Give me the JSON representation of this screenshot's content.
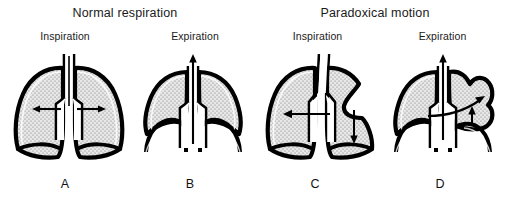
{
  "diagram": {
    "type": "medical-illustration",
    "background_color": "#ffffff",
    "ink_color": "#000000",
    "lung_fill_color": "#d9d9d9"
  },
  "groups": [
    {
      "id": "normal",
      "title": "Normal respiration",
      "title_x": 55,
      "title_y": 6,
      "title_width": 140
    },
    {
      "id": "paradoxical",
      "title": "Paradoxical motion",
      "title_x": 300,
      "title_y": 6,
      "title_width": 150
    }
  ],
  "panels": [
    {
      "id": "panel-a",
      "letter": "A",
      "phase": "Inspiration",
      "group": "normal",
      "figure_x": 6,
      "phase_x": 20,
      "phase_y": 30,
      "phase_width": 90,
      "letter_x": 40,
      "letter_y": 177,
      "letter_width": 50,
      "description": "Normal inspiration: lungs fully expanded, diaphragm flattened and descended, chest wall expands outward",
      "diaphragm": "flattened",
      "lung_size": "expanded",
      "arrows": [
        {
          "name": "trachea-airflow-down",
          "direction": "down",
          "style": "outline"
        },
        {
          "name": "chest-expansion-left",
          "direction": "left",
          "style": "solid"
        },
        {
          "name": "chest-expansion-right",
          "direction": "right",
          "style": "solid"
        }
      ]
    },
    {
      "id": "panel-b",
      "letter": "B",
      "phase": "Expiration",
      "group": "normal",
      "figure_x": 130,
      "phase_x": 150,
      "phase_y": 30,
      "phase_width": 90,
      "letter_x": 165,
      "letter_y": 177,
      "letter_width": 50,
      "description": "Normal expiration: lungs reduced in volume, diaphragm domed upward, air expelled through trachea",
      "diaphragm": "domed",
      "lung_size": "reduced",
      "arrows": [
        {
          "name": "trachea-airflow-up",
          "direction": "up",
          "style": "solid"
        }
      ]
    },
    {
      "id": "panel-c",
      "letter": "C",
      "phase": "Inspiration",
      "group": "paradoxical",
      "figure_x": 258,
      "phase_x": 270,
      "phase_y": 30,
      "phase_width": 95,
      "letter_x": 290,
      "letter_y": 177,
      "letter_width": 50,
      "description": "Paradoxical inspiration: flail segment sinks inward on the affected side, mediastinum shifts to the unaffected side and affected lung deflates",
      "diaphragm": "flattened",
      "lung_size": "expanded",
      "flail_side": "right",
      "flail_motion": "inward",
      "arrows": [
        {
          "name": "trachea-airflow-down",
          "direction": "down",
          "style": "outline"
        },
        {
          "name": "mediastinal-shift-left",
          "direction": "left",
          "style": "solid"
        },
        {
          "name": "flail-segment-collapse-down",
          "direction": "down",
          "style": "solid"
        }
      ]
    },
    {
      "id": "panel-d",
      "letter": "D",
      "phase": "Expiration",
      "group": "paradoxical",
      "figure_x": 380,
      "phase_x": 395,
      "phase_y": 30,
      "phase_width": 95,
      "letter_x": 415,
      "letter_y": 177,
      "letter_width": 50,
      "description": "Paradoxical expiration: flail segment bulges outward, mediastinum swings back toward the affected side as air shifts across",
      "diaphragm": "domed",
      "lung_size": "reduced",
      "flail_side": "right",
      "flail_motion": "outward",
      "arrows": [
        {
          "name": "trachea-airflow-up",
          "direction": "up",
          "style": "solid"
        },
        {
          "name": "mediastinal-shift-right",
          "direction": "right-curved",
          "style": "solid"
        },
        {
          "name": "flail-segment-bulge-up",
          "direction": "up",
          "style": "solid"
        }
      ]
    }
  ]
}
